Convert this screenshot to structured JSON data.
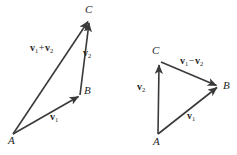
{
  "figure": {
    "background_color": "#ffffff",
    "stroke_color": "#3a3a3a",
    "text_color": "#262626"
  },
  "diagrams": [
    {
      "id": "vector-addition",
      "name": "vector-addition-diagram",
      "points": [
        {
          "id": "A",
          "label": "A",
          "x": 13,
          "y": 134,
          "label_x": 8,
          "label_y": 135
        },
        {
          "id": "B",
          "label": "B",
          "x": 80,
          "y": 95,
          "label_x": 84,
          "label_y": 85
        },
        {
          "id": "C",
          "label": "C",
          "x": 90,
          "y": 18,
          "label_x": 85,
          "label_y": 4
        }
      ],
      "vectors": [
        {
          "id": "v1",
          "name": "vector-v1",
          "symbol": "v",
          "subscript": "1",
          "from": "A",
          "to": "B",
          "label_x": 50,
          "label_y": 112,
          "operator": ""
        },
        {
          "id": "v2",
          "name": "vector-v2",
          "symbol": "v",
          "subscript": "2",
          "from": "B",
          "to": "C",
          "label_x": 83,
          "label_y": 48,
          "operator": ""
        },
        {
          "id": "v1plusv2",
          "name": "vector-v1-plus-v2",
          "symbol": "v",
          "subscript": "1",
          "symbol2": "v",
          "subscript2": "2",
          "operator": "+",
          "from": "A",
          "to": "C",
          "label_x": 30,
          "label_y": 43
        }
      ]
    },
    {
      "id": "vector-subtraction",
      "name": "vector-subtraction-diagram",
      "points": [
        {
          "id": "A",
          "label": "A",
          "x": 158,
          "y": 134,
          "label_x": 153,
          "label_y": 136
        },
        {
          "id": "B",
          "label": "B",
          "x": 219,
          "y": 86,
          "label_x": 223,
          "label_y": 80
        },
        {
          "id": "C",
          "label": "C",
          "x": 159,
          "y": 60,
          "label_x": 152,
          "label_y": 45
        }
      ],
      "vectors": [
        {
          "id": "v1",
          "name": "vector-v1",
          "symbol": "v",
          "subscript": "1",
          "from": "A",
          "to": "B",
          "label_x": 187,
          "label_y": 111,
          "operator": ""
        },
        {
          "id": "v2",
          "name": "vector-v2",
          "symbol": "v",
          "subscript": "2",
          "from": "A",
          "to": "C",
          "label_x": 137,
          "label_y": 82,
          "operator": ""
        },
        {
          "id": "v1minusv2",
          "name": "vector-v1-minus-v2",
          "symbol": "v",
          "subscript": "1",
          "symbol2": "v",
          "subscript2": "2",
          "operator": "−",
          "from": "C",
          "to": "B",
          "label_x": 180,
          "label_y": 56
        }
      ]
    }
  ]
}
